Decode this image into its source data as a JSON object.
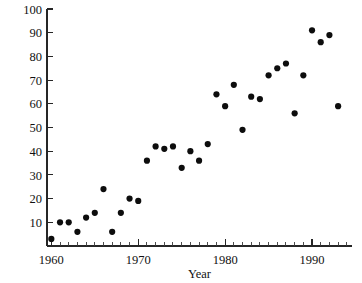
{
  "figure": {
    "clipped_top_text": "                                                                                       ",
    "background_color": "#ffffff",
    "ink_color": "#111111"
  },
  "chart_data": {
    "type": "scatter",
    "title": "",
    "xlabel": "Year",
    "ylabel": "",
    "xlim": [
      1959.5,
      1994.6
    ],
    "ylim": [
      0,
      100
    ],
    "grid": false,
    "legend": null,
    "marker": {
      "shape": "circle",
      "color": "#0d0d0d",
      "size": 3.1
    },
    "x_major_ticks": [
      1960,
      1970,
      1980,
      1990
    ],
    "x_major_tick_labels": [
      "1960",
      "1970",
      "1980",
      "1990"
    ],
    "x_minor_tick_step": 1,
    "y_ticks": [
      0,
      10,
      20,
      30,
      40,
      50,
      60,
      70,
      80,
      90,
      100
    ],
    "y_tick_labels": [
      "",
      "10",
      "20",
      "30",
      "40",
      "50",
      "60",
      "70",
      "80",
      "90",
      "100"
    ],
    "x": [
      1960,
      1961,
      1962,
      1963,
      1964,
      1965,
      1966,
      1967,
      1968,
      1969,
      1970,
      1971,
      1972,
      1973,
      1974,
      1975,
      1976,
      1977,
      1978,
      1979,
      1980,
      1981,
      1982,
      1983,
      1984,
      1985,
      1986,
      1987,
      1988,
      1989,
      1990,
      1991,
      1992,
      1993
    ],
    "y": [
      3,
      10,
      10,
      6,
      12,
      14,
      24,
      6,
      14,
      20,
      19,
      36,
      42,
      41,
      42,
      33,
      40,
      36,
      43,
      64,
      59,
      68,
      49,
      63,
      62,
      72,
      75,
      77,
      56,
      72,
      91,
      86,
      89,
      59
    ],
    "points": [
      {
        "x": 1960,
        "y": 3
      },
      {
        "x": 1961,
        "y": 10
      },
      {
        "x": 1962,
        "y": 10
      },
      {
        "x": 1963,
        "y": 6
      },
      {
        "x": 1964,
        "y": 12
      },
      {
        "x": 1965,
        "y": 14
      },
      {
        "x": 1966,
        "y": 24
      },
      {
        "x": 1967,
        "y": 6
      },
      {
        "x": 1968,
        "y": 14
      },
      {
        "x": 1969,
        "y": 20
      },
      {
        "x": 1970,
        "y": 19
      },
      {
        "x": 1971,
        "y": 36
      },
      {
        "x": 1972,
        "y": 42
      },
      {
        "x": 1973,
        "y": 41
      },
      {
        "x": 1974,
        "y": 42
      },
      {
        "x": 1975,
        "y": 33
      },
      {
        "x": 1976,
        "y": 40
      },
      {
        "x": 1977,
        "y": 36
      },
      {
        "x": 1978,
        "y": 43
      },
      {
        "x": 1979,
        "y": 64
      },
      {
        "x": 1980,
        "y": 59
      },
      {
        "x": 1981,
        "y": 68
      },
      {
        "x": 1982,
        "y": 49
      },
      {
        "x": 1983,
        "y": 63
      },
      {
        "x": 1984,
        "y": 62
      },
      {
        "x": 1985,
        "y": 72
      },
      {
        "x": 1986,
        "y": 75
      },
      {
        "x": 1987,
        "y": 77
      },
      {
        "x": 1988,
        "y": 56
      },
      {
        "x": 1989,
        "y": 72
      },
      {
        "x": 1990,
        "y": 91
      },
      {
        "x": 1991,
        "y": 86
      },
      {
        "x": 1992,
        "y": 89
      },
      {
        "x": 1993,
        "y": 59
      }
    ]
  }
}
